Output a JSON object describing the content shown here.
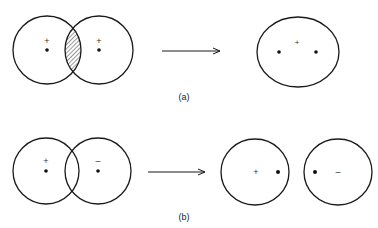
{
  "figure": {
    "panel_a": {
      "label": "(a)",
      "before": {
        "left_nucleus": {
          "charge": "+"
        },
        "right_nucleus": {
          "charge": "+"
        },
        "overlap": "hatched"
      },
      "after": {
        "center_charge": "+"
      }
    },
    "panel_b": {
      "label": "(b)",
      "before": {
        "left_nucleus": {
          "charge": "+"
        },
        "right_nucleus": {
          "charge": "–"
        }
      },
      "after": {
        "left_charge": "+",
        "right_charge": "–"
      }
    }
  },
  "colors": {
    "stroke": "#1a1a1a",
    "background": "#ffffff"
  }
}
